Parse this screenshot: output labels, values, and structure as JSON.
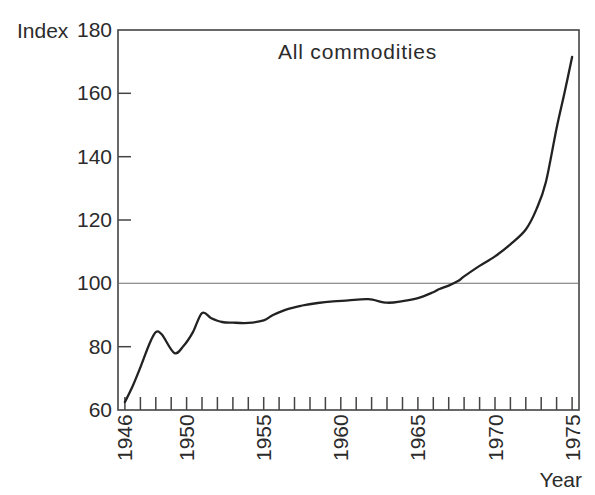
{
  "figure": {
    "background": "#ffffff",
    "text_color": "#2b2b2b"
  },
  "chart_data": {
    "type": "line",
    "title": "All commodities",
    "xlabel": "Year",
    "ylabel": "Index",
    "xlim": [
      1945.55,
      1975.45
    ],
    "ylim": [
      60,
      180
    ],
    "x_major_ticks": [
      1946,
      1950,
      1955,
      1960,
      1965,
      1970,
      1975
    ],
    "x_minor_tick_step": 1,
    "y_ticks": [
      60,
      80,
      100,
      120,
      140,
      160,
      180
    ],
    "reference_line_y": 100,
    "grid": false,
    "legend": "none",
    "line_color": "#222222",
    "axis_color": "#444444",
    "reference_line_color": "#6e6e6e",
    "series": [
      {
        "name": "All commodities",
        "points": [
          [
            1946.0,
            62.5
          ],
          [
            1946.5,
            67.5
          ],
          [
            1947.0,
            73.5
          ],
          [
            1947.6,
            81.0
          ],
          [
            1948.0,
            84.6
          ],
          [
            1948.4,
            83.8
          ],
          [
            1949.2,
            78.0
          ],
          [
            1949.8,
            80.2
          ],
          [
            1950.4,
            84.5
          ],
          [
            1951.0,
            90.6
          ],
          [
            1951.6,
            89.0
          ],
          [
            1952.3,
            87.8
          ],
          [
            1953.0,
            87.6
          ],
          [
            1954.0,
            87.5
          ],
          [
            1955.0,
            88.3
          ],
          [
            1955.6,
            90.0
          ],
          [
            1956.5,
            91.8
          ],
          [
            1957.5,
            93.0
          ],
          [
            1958.5,
            93.8
          ],
          [
            1959.5,
            94.3
          ],
          [
            1960.5,
            94.6
          ],
          [
            1961.8,
            95.0
          ],
          [
            1963.0,
            93.9
          ],
          [
            1964.0,
            94.4
          ],
          [
            1965.0,
            95.3
          ],
          [
            1966.0,
            97.2
          ],
          [
            1966.4,
            98.2
          ],
          [
            1967.0,
            99.3
          ],
          [
            1967.6,
            100.7
          ],
          [
            1968.0,
            102.2
          ],
          [
            1969.0,
            105.5
          ],
          [
            1970.0,
            108.5
          ],
          [
            1971.0,
            112.3
          ],
          [
            1972.0,
            117.0
          ],
          [
            1972.7,
            123.5
          ],
          [
            1973.3,
            132.0
          ],
          [
            1974.0,
            149.0
          ],
          [
            1974.5,
            160.0
          ],
          [
            1975.0,
            171.5
          ]
        ]
      }
    ]
  }
}
